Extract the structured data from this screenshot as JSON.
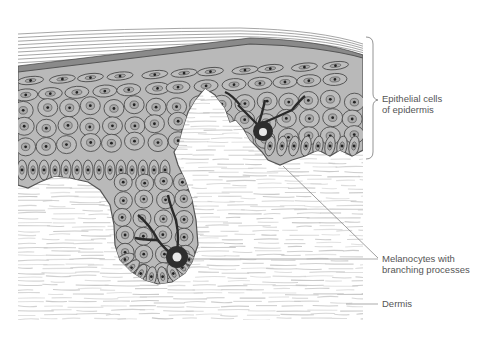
{
  "figure": {
    "colors": {
      "background": "#ffffff",
      "cell_fill": "#b8b8b8",
      "cell_outline": "#4a4a4a",
      "melanocyte": "#2e2e2e",
      "stratum_corneum": "#8c8c8c",
      "dermis_fibers": "#c4c4c4",
      "label_text": "#555555",
      "leader_line": "#777777"
    }
  },
  "labels": {
    "epithelial": {
      "line1": "Epithelial cells",
      "line2": "of epidermis"
    },
    "melanocytes": {
      "line1": "Melanocytes with",
      "line2": "branching processes"
    },
    "dermis": {
      "line1": "Dermis"
    }
  }
}
